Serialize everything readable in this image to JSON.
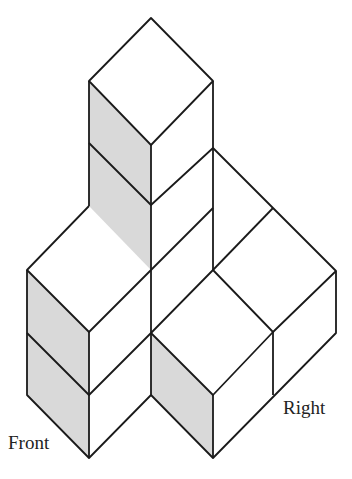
{
  "diagram": {
    "type": "isometric-cube-structure",
    "cube_count": 7,
    "colors": {
      "stroke": "#1a1a1a",
      "shaded_face": "#d9d9d9",
      "face": "#ffffff"
    },
    "labels": {
      "front": "Front",
      "right": "Right"
    },
    "shaded_faces": [
      "M89,81 L151,145 L151,270 L89,206 Z",
      "M27,270 L89,332 L89,458 L27,395 Z",
      "M151,333 L213,395 L213,458 L151,395 Z"
    ],
    "edges": [
      "M151,18 L213,81 L151,145 L89,81 Z",
      "M89,81 L89,206",
      "M151,145 L151,395",
      "M213,81 L213,270",
      "M89,143 L151,205 L213,148",
      "M151,270 L213,208",
      "M89,206 L27,270 L89,332 L151,270",
      "M27,270 L27,395 L89,458 L151,395",
      "M89,332 L89,458",
      "M27,333 L89,395 L151,333",
      "M213,148 L336,271 L336,333 L213,458 L151,395",
      "M273,208 L213,270",
      "M151,333 L213,270 L273,332 L336,271",
      "M151,333 L213,395 L273,332",
      "M273,332 L273,395",
      "M213,395 L213,458"
    ]
  }
}
